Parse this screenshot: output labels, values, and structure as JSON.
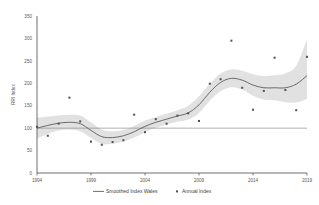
{
  "chart_data": {
    "type": "line",
    "title": "",
    "xlabel": "",
    "ylabel": "RRI Index",
    "xlim": [
      1994,
      2019
    ],
    "ylim": [
      0,
      350
    ],
    "grid": false,
    "legend_position": "bottom",
    "x_ticks": [
      "1994",
      "1999",
      "2004",
      "2009",
      "2014",
      "2019"
    ],
    "x_tick_values": [
      1994,
      1999,
      2004,
      2009,
      2014,
      2019
    ],
    "y_ticks": [
      "0",
      "50",
      "100",
      "150",
      "200",
      "250",
      "300",
      "350"
    ],
    "y_tick_values": [
      0,
      50,
      100,
      150,
      200,
      250,
      300,
      350
    ],
    "reference_line": {
      "value": 100,
      "label": "100"
    },
    "x": [
      1994,
      1995,
      1996,
      1997,
      1998,
      1999,
      2000,
      2001,
      2002,
      2003,
      2004,
      2005,
      2006,
      2007,
      2008,
      2009,
      2010,
      2011,
      2012,
      2013,
      2014,
      2015,
      2016,
      2017,
      2018,
      2019
    ],
    "series": [
      {
        "name": "Annual Index",
        "type": "scatter",
        "marker": "square",
        "color": "#4f4f4f",
        "values": [
          103,
          83,
          110,
          168,
          115,
          70,
          63,
          69,
          73,
          130,
          91,
          120,
          110,
          128,
          133,
          116,
          199,
          209,
          295,
          190,
          141,
          183,
          257,
          185,
          140,
          259
        ]
      },
      {
        "name": "Smoothed Index Wales",
        "type": "line",
        "color": "#5c5c5c",
        "values": [
          100,
          106,
          111,
          113,
          110,
          95,
          81,
          79,
          83,
          92,
          104,
          113,
          120,
          127,
          134,
          152,
          180,
          202,
          211,
          207,
          196,
          190,
          190,
          190,
          198,
          217
        ]
      },
      {
        "name": "Confidence Band Upper",
        "type": "band",
        "values": [
          123,
          126,
          128,
          130,
          128,
          113,
          97,
          93,
          96,
          105,
          117,
          125,
          132,
          140,
          150,
          171,
          199,
          222,
          231,
          228,
          220,
          216,
          218,
          222,
          239,
          298
        ]
      },
      {
        "name": "Confidence Band Lower",
        "type": "band",
        "values": [
          77,
          87,
          95,
          97,
          93,
          78,
          65,
          65,
          70,
          79,
          91,
          101,
          108,
          114,
          119,
          134,
          161,
          182,
          191,
          186,
          172,
          164,
          162,
          158,
          157,
          165
        ]
      }
    ],
    "legend": [
      {
        "label": "Smoothed Index Wales",
        "marker": "line",
        "color": "#5c5c5c"
      },
      {
        "label": "Annual Index",
        "marker": "square",
        "color": "#4f4f4f"
      }
    ]
  }
}
